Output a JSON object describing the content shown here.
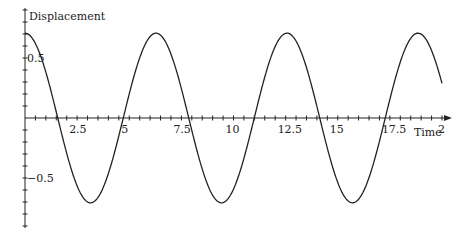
{
  "chart_data": {
    "type": "line",
    "title": "",
    "xlabel": "Time",
    "ylabel": "Displacement",
    "xlim": [
      0,
      20
    ],
    "ylim": [
      -0.9,
      0.9
    ],
    "x_ticks": [
      2.5,
      5,
      7.5,
      10,
      12.5,
      15,
      17.5,
      20
    ],
    "x_tick_labels": [
      "2.5",
      "5",
      "7.5",
      "10",
      "12.5",
      "15",
      "17.5",
      "2"
    ],
    "y_ticks": [
      0.5,
      -0.5
    ],
    "y_tick_labels": [
      "0.5",
      "-0.5"
    ],
    "grid": false,
    "legend": null,
    "series": [
      {
        "name": "displacement",
        "function": "0.707*cos(t)",
        "amplitude": 0.707,
        "period": 6.283,
        "x": [
          0,
          1.57,
          3.14,
          4.71,
          6.28,
          7.85,
          9.42,
          11.0,
          12.57,
          14.14,
          15.71,
          17.28,
          18.85,
          20
        ],
        "values": [
          0.707,
          0,
          -0.707,
          0,
          0.707,
          0,
          -0.707,
          0,
          0.707,
          0,
          -0.707,
          0,
          0.707,
          0.289
        ]
      }
    ]
  },
  "axes": {
    "x_label": "Time",
    "y_label": "Displacement"
  }
}
